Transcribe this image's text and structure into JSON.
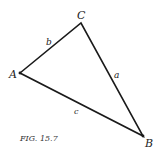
{
  "figure": {
    "caption": "FIG. 15.7",
    "vertices": {
      "A": {
        "label": "A",
        "x": 20,
        "y": 73
      },
      "B": {
        "label": "B",
        "x": 143,
        "y": 136
      },
      "C": {
        "label": "C",
        "x": 81,
        "y": 23
      }
    },
    "sides": {
      "a": {
        "label": "a",
        "from": "C",
        "to": "B"
      },
      "b": {
        "label": "b",
        "from": "A",
        "to": "C"
      },
      "c": {
        "label": "c",
        "from": "A",
        "to": "B"
      }
    },
    "stroke_color": "#1a1a1a"
  }
}
